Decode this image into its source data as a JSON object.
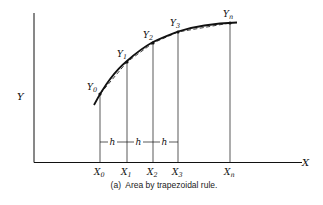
{
  "figure": {
    "caption": "(a)  Area by trapezoidal rule.",
    "axes": {
      "x_label": "X",
      "y_label": "Y"
    },
    "x_ticks": [
      {
        "name": "X",
        "sub": "0"
      },
      {
        "name": "X",
        "sub": "1"
      },
      {
        "name": "X",
        "sub": "2"
      },
      {
        "name": "X",
        "sub": "3"
      },
      {
        "name": "X",
        "sub": "n"
      }
    ],
    "points": [
      {
        "name": "Y",
        "sub": "0"
      },
      {
        "name": "Y",
        "sub": "1"
      },
      {
        "name": "Y",
        "sub": "2"
      },
      {
        "name": "Y",
        "sub": "3"
      },
      {
        "name": "Y",
        "sub": "n"
      }
    ],
    "interval_label": "h",
    "colors": {
      "ink": "#111111",
      "background": "#ffffff"
    }
  }
}
